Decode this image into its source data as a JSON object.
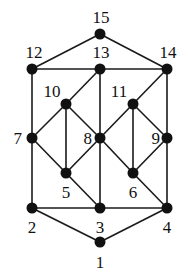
{
  "diagram": {
    "type": "graph",
    "nodes": [
      {
        "id": "1",
        "x": 100,
        "y": 242,
        "lx": 100,
        "ly": 268,
        "anchor": "middle"
      },
      {
        "id": "2",
        "x": 32,
        "y": 208,
        "lx": 32,
        "ly": 233,
        "anchor": "middle"
      },
      {
        "id": "3",
        "x": 100,
        "y": 208,
        "lx": 100,
        "ly": 233,
        "anchor": "middle"
      },
      {
        "id": "4",
        "x": 167,
        "y": 208,
        "lx": 167,
        "ly": 233,
        "anchor": "middle"
      },
      {
        "id": "5",
        "x": 66,
        "y": 173,
        "lx": 66,
        "ly": 198,
        "anchor": "middle"
      },
      {
        "id": "6",
        "x": 133,
        "y": 173,
        "lx": 133,
        "ly": 198,
        "anchor": "middle"
      },
      {
        "id": "7",
        "x": 32,
        "y": 138,
        "lx": 22,
        "ly": 144,
        "anchor": "end"
      },
      {
        "id": "8",
        "x": 100,
        "y": 138,
        "lx": 92,
        "ly": 144,
        "anchor": "end"
      },
      {
        "id": "9",
        "x": 167,
        "y": 138,
        "lx": 160,
        "ly": 144,
        "anchor": "end"
      },
      {
        "id": "10",
        "x": 66,
        "y": 104,
        "lx": 52,
        "ly": 97,
        "anchor": "middle"
      },
      {
        "id": "11",
        "x": 133,
        "y": 104,
        "lx": 119,
        "ly": 97,
        "anchor": "middle"
      },
      {
        "id": "12",
        "x": 32,
        "y": 69,
        "lx": 34,
        "ly": 58,
        "anchor": "middle"
      },
      {
        "id": "13",
        "x": 100,
        "y": 69,
        "lx": 101,
        "ly": 58,
        "anchor": "middle"
      },
      {
        "id": "14",
        "x": 167,
        "y": 69,
        "lx": 168,
        "ly": 58,
        "anchor": "middle"
      },
      {
        "id": "15",
        "x": 100,
        "y": 34,
        "lx": 101,
        "ly": 23,
        "anchor": "middle"
      }
    ],
    "edges": [
      [
        "15",
        "12"
      ],
      [
        "15",
        "14"
      ],
      [
        "12",
        "13"
      ],
      [
        "13",
        "14"
      ],
      [
        "12",
        "7"
      ],
      [
        "13",
        "10"
      ],
      [
        "13",
        "8"
      ],
      [
        "14",
        "11"
      ],
      [
        "14",
        "9"
      ],
      [
        "10",
        "7"
      ],
      [
        "10",
        "5"
      ],
      [
        "10",
        "8"
      ],
      [
        "11",
        "8"
      ],
      [
        "11",
        "6"
      ],
      [
        "11",
        "9"
      ],
      [
        "7",
        "5"
      ],
      [
        "8",
        "5"
      ],
      [
        "8",
        "6"
      ],
      [
        "9",
        "6"
      ],
      [
        "7",
        "2"
      ],
      [
        "5",
        "3"
      ],
      [
        "8",
        "3"
      ],
      [
        "6",
        "4"
      ],
      [
        "9",
        "4"
      ],
      [
        "2",
        "3"
      ],
      [
        "3",
        "4"
      ],
      [
        "2",
        "1"
      ],
      [
        "4",
        "1"
      ]
    ],
    "colors": {
      "node": "#111111",
      "edge": "#1a1a1a",
      "background": "#ffffff"
    }
  }
}
